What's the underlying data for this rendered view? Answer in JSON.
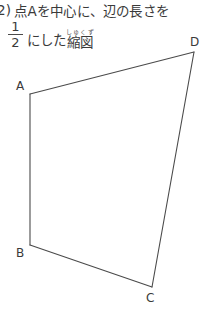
{
  "page": {
    "background_color": "#ffffff",
    "ink_color": "#3a3a3a",
    "line_color": "#4a4a4a"
  },
  "problem": {
    "number": "2)",
    "line1": "点Aを中心に、辺の長さを",
    "fraction": {
      "numerator": "1",
      "denominator": "2"
    },
    "line2_after_fraction": "にした",
    "ruby_base": "縮図",
    "ruby_text": "しゅくず",
    "full_text": "2) 点Aを中心に、辺の長さを 1/2 にした縮図"
  },
  "figure": {
    "name": "quadrilateral-ABCD",
    "stroke_color": "#4a4a4a",
    "stroke_width": 1.1,
    "fill": "none",
    "vertices": [
      {
        "label": "A",
        "x": 30,
        "y": 94
      },
      {
        "label": "B",
        "x": 30,
        "y": 245
      },
      {
        "label": "C",
        "x": 152,
        "y": 287
      },
      {
        "label": "D",
        "x": 194,
        "y": 52
      }
    ],
    "edges": [
      "A-D",
      "A-B",
      "B-C",
      "C-D"
    ],
    "labels": {
      "A": "A",
      "B": "B",
      "C": "C",
      "D": "D"
    }
  }
}
